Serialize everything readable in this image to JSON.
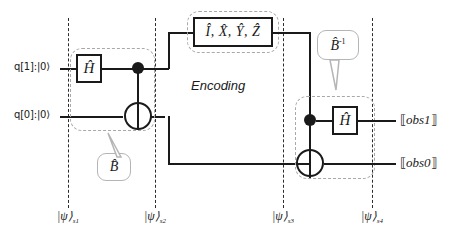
{
  "figure": {
    "background": "#ffffff",
    "wire_color": "#1a1a1a",
    "group_color": "#a8a8a8",
    "divider_color": "#2b2b2b"
  },
  "qubits": [
    {
      "name": "q1",
      "label": "q[1]:|0⟩"
    },
    {
      "name": "q0",
      "label": "q[0]:|0⟩"
    }
  ],
  "gates": {
    "h_prepare": {
      "label": "Ĥ"
    },
    "h_measure": {
      "label": "Ĥ"
    },
    "encoding_ops": {
      "label": "Î, X̂, Ŷ, Ẑ"
    }
  },
  "captions": {
    "encoding": "Encoding"
  },
  "callouts": [
    {
      "name": "b-forward",
      "label": "B̂",
      "sup": ""
    },
    {
      "name": "b-inverse",
      "label": "B̂",
      "sup": "-1"
    }
  ],
  "observables": [
    {
      "name": "obs1",
      "label": "⟦obs1⟧",
      "text": "obs1"
    },
    {
      "name": "obs0",
      "label": "⟦obs0⟧",
      "text": "obs0"
    }
  ],
  "state_labels": [
    {
      "name": "psi-s1",
      "psi": "|ψ⟩",
      "sub": "s1"
    },
    {
      "name": "psi-s2",
      "psi": "|ψ⟩",
      "sub": "s2"
    },
    {
      "name": "psi-s3",
      "psi": "|ψ⟩",
      "sub": "s3"
    },
    {
      "name": "psi-s4",
      "psi": "|ψ⟩",
      "sub": "s4"
    }
  ]
}
